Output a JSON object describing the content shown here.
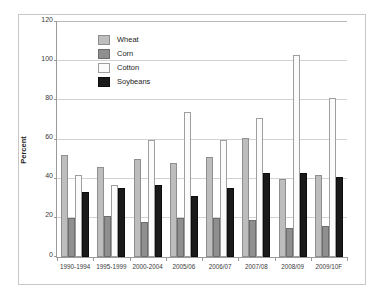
{
  "chart_data": {
    "type": "bar",
    "title": "",
    "subtitle": "",
    "xlabel": "",
    "ylabel": "Percent",
    "ylim": [
      0,
      120
    ],
    "yticks": [
      0,
      20,
      40,
      60,
      80,
      100,
      120
    ],
    "grid": true,
    "legend_position": "upper-left-inside",
    "categories": [
      "1990-1994",
      "1995-1999",
      "2000-2004",
      "2005/06",
      "2006/07",
      "2007/08",
      "2008/09",
      "2009/10F"
    ],
    "series": [
      {
        "name": "Wheat",
        "color": "#bdbdbd",
        "values": [
          52,
          46,
          50,
          48,
          51,
          61,
          40,
          42
        ]
      },
      {
        "name": "Corn",
        "color": "#8f8f8f",
        "values": [
          20,
          21,
          18,
          20,
          20,
          19,
          15,
          16
        ]
      },
      {
        "name": "Cotton",
        "color": "#fbfbfb",
        "values": [
          42,
          37,
          60,
          74,
          60,
          71,
          103,
          81
        ]
      },
      {
        "name": "Soybeans",
        "color": "#1a1a1a",
        "values": [
          33,
          35,
          37,
          31,
          35,
          43,
          43,
          41
        ]
      }
    ]
  }
}
